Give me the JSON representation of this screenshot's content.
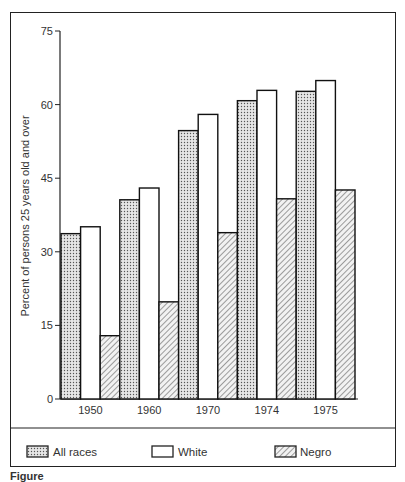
{
  "chart_data": {
    "type": "bar",
    "title": "",
    "xlabel": "",
    "ylabel": "Percent of persons 25 years old and over",
    "categories": [
      "1950",
      "1960",
      "1970",
      "1974",
      "1975"
    ],
    "series": [
      {
        "name": "All races",
        "pattern": "dots",
        "values": [
          33.7,
          40.6,
          54.7,
          60.8,
          62.7
        ]
      },
      {
        "name": "White",
        "pattern": "none",
        "values": [
          35.1,
          43.0,
          58.0,
          62.9,
          64.9
        ]
      },
      {
        "name": "Negro",
        "pattern": "hatch",
        "values": [
          12.9,
          19.8,
          33.9,
          40.8,
          42.6
        ]
      }
    ],
    "yticks": [
      0,
      15,
      30,
      45,
      60,
      75
    ],
    "ylim": [
      0,
      75
    ],
    "grid": false,
    "legend_position": "bottom"
  },
  "legend": {
    "all_races": "All races",
    "white": "White",
    "negro": "Negro"
  },
  "caption": "Figure"
}
